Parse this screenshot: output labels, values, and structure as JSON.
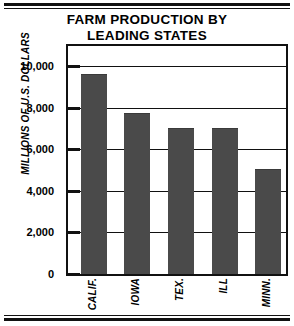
{
  "chart_data": {
    "type": "bar",
    "title": "FARM PRODUCTION BY LEADING STATES",
    "title_lines": [
      "FARM PRODUCTION BY",
      "LEADING STATES"
    ],
    "xlabel": "",
    "ylabel": "MILLIONS OF U.S. DOLLARS",
    "categories": [
      "CALIF.",
      "IOWA",
      "TEX.",
      "ILL",
      "MINN."
    ],
    "values": [
      9600,
      7700,
      7000,
      7000,
      5000
    ],
    "ylim": [
      0,
      11000
    ],
    "yticks": [
      0,
      2000,
      4000,
      6000,
      8000,
      10000
    ],
    "ytick_labels": [
      "0",
      "2,000",
      "4,000",
      "6,000",
      "8,000",
      "10,000"
    ],
    "grid": true,
    "legend": "none",
    "bar_color": "#4a4a4a",
    "axis_color": "#111111",
    "background": "#ffffff"
  }
}
